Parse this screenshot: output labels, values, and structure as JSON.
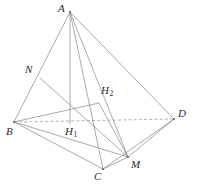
{
  "figure": {
    "background_color": "#ffffff",
    "line_color": "#8d8d8d",
    "dashed_line_color": "#9a9a9a",
    "label_color": "#2b2b2b",
    "vertices": [
      {
        "id": "A",
        "label": "A",
        "sub": "",
        "x": 70,
        "y": 12,
        "label_x": 58,
        "label_y": 3
      },
      {
        "id": "B",
        "label": "B",
        "sub": "",
        "x": 14,
        "y": 122,
        "label_x": 6,
        "label_y": 126
      },
      {
        "id": "C",
        "label": "C",
        "sub": "",
        "x": 103,
        "y": 169,
        "label_x": 94,
        "label_y": 171
      },
      {
        "id": "D",
        "label": "D",
        "sub": "",
        "x": 174,
        "y": 119,
        "label_x": 178,
        "label_y": 108
      },
      {
        "id": "M",
        "label": "M",
        "sub": "",
        "x": 128,
        "y": 157,
        "label_x": 131,
        "label_y": 159
      },
      {
        "id": "N",
        "label": "N",
        "sub": "",
        "x": 40,
        "y": 78,
        "label_x": 25,
        "label_y": 64
      },
      {
        "id": "H1",
        "label": "H",
        "sub": "1",
        "x": 70,
        "y": 124,
        "label_x": 65,
        "label_y": 126
      },
      {
        "id": "H2",
        "label": "H",
        "sub": "2",
        "x": 99,
        "y": 103,
        "label_x": 101,
        "label_y": 85
      }
    ],
    "solid_edges": [
      {
        "name": "edge-A-B",
        "from": "A",
        "to": "B"
      },
      {
        "name": "edge-A-C",
        "from": "A",
        "to": "C"
      },
      {
        "name": "edge-A-D",
        "from": "A",
        "to": "D"
      },
      {
        "name": "edge-A-M",
        "from": "A",
        "to": "M"
      },
      {
        "name": "edge-A-H1",
        "from": "A",
        "to": "H1"
      },
      {
        "name": "edge-B-C",
        "from": "B",
        "to": "C"
      },
      {
        "name": "edge-B-M",
        "from": "B",
        "to": "M"
      },
      {
        "name": "edge-B-H2",
        "from": "B",
        "to": "H2"
      },
      {
        "name": "edge-C-M",
        "from": "C",
        "to": "M"
      },
      {
        "name": "edge-C-D",
        "from": "C",
        "to": "D"
      },
      {
        "name": "edge-M-D",
        "from": "M",
        "to": "D"
      },
      {
        "name": "edge-N-M",
        "from": "N",
        "to": "M"
      },
      {
        "name": "edge-H2-M",
        "from": "H2",
        "to": "M"
      }
    ],
    "dashed_edges": [
      {
        "name": "edge-B-D",
        "from": "B",
        "to": "D"
      }
    ]
  }
}
